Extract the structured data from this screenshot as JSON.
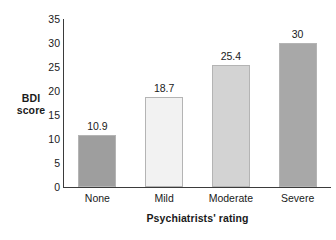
{
  "chart_data": {
    "type": "bar",
    "title": "",
    "categories": [
      "None",
      "Mild",
      "Moderate",
      "Severe"
    ],
    "values": [
      10.9,
      18.7,
      25.4,
      30
    ],
    "value_labels": [
      "10.9",
      "18.7",
      "25.4",
      "30"
    ],
    "xlabel": "Psychiatrists' rating",
    "ylabel_line1": "BDI",
    "ylabel_line2": "score",
    "ylabel": "BDI score",
    "ylim": [
      0,
      35
    ],
    "ytick_labels": [
      "35",
      "30",
      "25",
      "20",
      "15",
      "10",
      "5",
      "0"
    ],
    "ytick_values": [
      35,
      30,
      25,
      20,
      15,
      10,
      5,
      0
    ],
    "grid": false,
    "legend": false,
    "bar_colors": [
      "#9e9e9e",
      "#f2f2f2",
      "#d3d3d3",
      "#a8a8a8"
    ],
    "axis_color": "#3b3b3b",
    "background": "#ffffff"
  }
}
